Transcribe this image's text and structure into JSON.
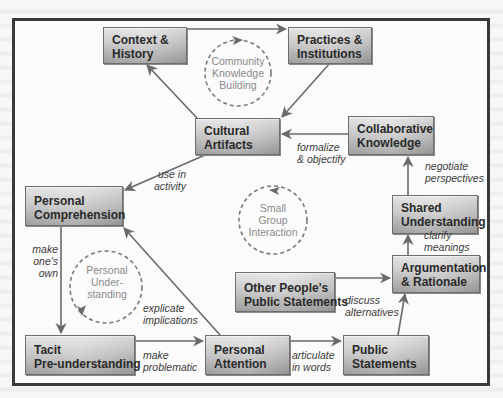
{
  "diagram": {
    "boxes": {
      "context_history": [
        "Context &",
        "History"
      ],
      "practices_institutions": [
        "Practices &",
        "Institutions"
      ],
      "cultural_artifacts": [
        "Cultural",
        "Artifacts"
      ],
      "collaborative_knowledge": [
        "Collaborative",
        "Knowledge"
      ],
      "personal_comprehension": [
        "Personal",
        "Comprehension"
      ],
      "shared_understanding": [
        "Shared",
        "Understanding"
      ],
      "argumentation_rationale": [
        "Argumentation",
        "& Rationale"
      ],
      "other_public_statements": [
        "Other People's",
        "Public Statements"
      ],
      "tacit_preunderstanding": [
        "Tacit",
        "Pre-understanding"
      ],
      "personal_attention": [
        "Personal",
        "Attention"
      ],
      "public_statements": [
        "Public",
        "Statements"
      ]
    },
    "edge_labels": {
      "formalize_objectify": [
        "formalize",
        "& objectify"
      ],
      "use_in_activity": [
        "use in",
        "activity"
      ],
      "negotiate_perspectives": [
        "negotiate",
        "perspectives"
      ],
      "clarify_meanings": [
        "clarify",
        "meanings"
      ],
      "make_ones_own": [
        "make",
        "one's",
        "own"
      ],
      "explicate_implications": [
        "explicate",
        "implications"
      ],
      "discuss_alternatives": [
        "discuss",
        "alternatives"
      ],
      "make_problematic": [
        "make",
        "problematic"
      ],
      "articulate_in_words": [
        "articulate",
        "in words"
      ]
    },
    "cycles": {
      "community": [
        "Community",
        "Knowledge",
        "Building"
      ],
      "small_group": [
        "Small",
        "Group",
        "Interaction"
      ],
      "personal": [
        "Personal",
        "Under-",
        "standing"
      ]
    },
    "colors": {
      "frame": "#3a3a3a",
      "arrow": "#6a6a6a",
      "cycle": "#7a7a7a",
      "box_top": "#e4e4e4",
      "box_bottom": "#9d9d9d",
      "box_text": "#2a2a2a",
      "cycle_text": "#8a8a8a"
    }
  }
}
